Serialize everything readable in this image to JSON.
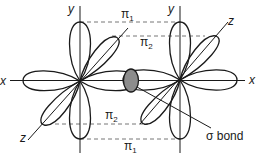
{
  "axes": {
    "left": {
      "x_label": "x",
      "y_label": "y",
      "z_label": "z"
    },
    "right": {
      "x_label": "x",
      "y_label": "y",
      "z_label": "z"
    }
  },
  "pi_bonds": {
    "top_pi1": {
      "symbol": "π",
      "sub": "1"
    },
    "top_pi2": {
      "symbol": "π",
      "sub": "2"
    },
    "bottom_pi2": {
      "symbol": "π",
      "sub": "2"
    },
    "bottom_pi1": {
      "symbol": "π",
      "sub": "1"
    }
  },
  "sigma_bond": {
    "label": "σ bond"
  },
  "colors": {
    "stroke": "#1a1a1a",
    "sigma_fill": "#8c8c8c",
    "dashed": "#666666",
    "background": "#ffffff"
  }
}
